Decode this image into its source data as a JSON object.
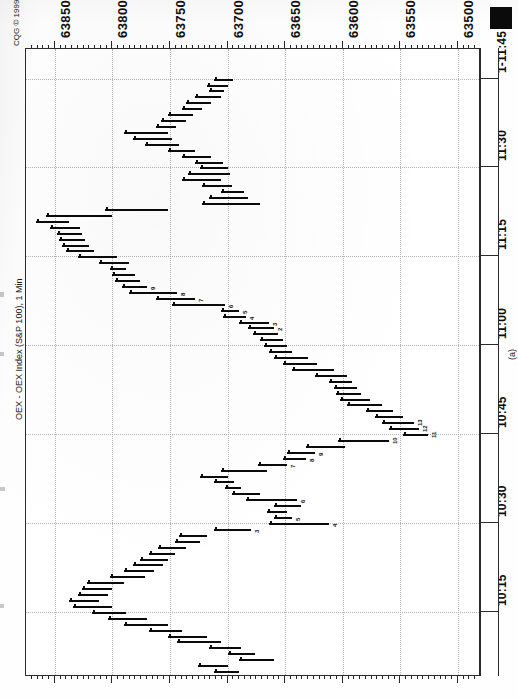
{
  "meta": {
    "vendor_copyright": "CQG © 1999.",
    "instrument_title": "OEX - OEX Index (S&P 100), 1 Min",
    "study_label": "TDSeq",
    "figure_caption": "(a)"
  },
  "price_axis": {
    "label_position": "top",
    "orientation": "vertical-text",
    "labels": [
      "63850",
      "63800",
      "63750",
      "63700",
      "63650",
      "63600",
      "63550",
      "63500"
    ],
    "values": [
      63850,
      63800,
      63750,
      63700,
      63650,
      63600,
      63550,
      63500
    ],
    "major_step": 50,
    "minor_step": 5
  },
  "time_axis": {
    "label_position": "right",
    "orientation": "vertical-text",
    "labels": [
      "1-11:45",
      "11:30",
      "11:15",
      "11:00",
      "10:45",
      "10:30",
      "10:15"
    ],
    "major_step_minutes": 15
  },
  "chart_data": {
    "type": "bar",
    "title": "OEX - OEX Index (S&P 100), 1 Min",
    "subtitle": "CQG © 1999.",
    "caption": "(a)",
    "study": "TDSeq",
    "xlabel": "Price",
    "ylabel": "Time",
    "grid": true,
    "legend": "none",
    "orientation": "rotated-90",
    "xlim": [
      63480,
      63875
    ],
    "ylim": [
      "10:05",
      "11:50"
    ],
    "x_ticks": [
      63850,
      63800,
      63750,
      63700,
      63650,
      63600,
      63550,
      63500
    ],
    "y_ticks": [
      "1-11:45",
      "11:30",
      "11:15",
      "11:00",
      "10:45",
      "10:30",
      "10:15"
    ],
    "series": [
      {
        "name": "OEX 1-min price bars",
        "note": "Each bar is one 1-minute high/low range plotted sideways; time runs top (11:45) to bottom (10:05).",
        "points": [
          {
            "t": "11:45",
            "low": 63695,
            "high": 63712,
            "td": null
          },
          {
            "t": "11:44",
            "low": 63700,
            "high": 63718,
            "td": null
          },
          {
            "t": "11:43",
            "low": 63703,
            "high": 63716,
            "td": null
          },
          {
            "t": "11:42",
            "low": 63706,
            "high": 63728,
            "td": null
          },
          {
            "t": "11:41",
            "low": 63714,
            "high": 63736,
            "td": null
          },
          {
            "t": "11:40",
            "low": 63722,
            "high": 63740,
            "td": null
          },
          {
            "t": "11:39",
            "low": 63730,
            "high": 63752,
            "td": null
          },
          {
            "t": "11:38",
            "low": 63736,
            "high": 63758,
            "td": null
          },
          {
            "t": "11:37",
            "low": 63745,
            "high": 63762,
            "td": null
          },
          {
            "t": "11:36",
            "low": 63752,
            "high": 63790,
            "td": null
          },
          {
            "t": "11:35",
            "low": 63748,
            "high": 63782,
            "td": null
          },
          {
            "t": "11:34",
            "low": 63742,
            "high": 63772,
            "td": null
          },
          {
            "t": "11:33",
            "low": 63728,
            "high": 63752,
            "td": null
          },
          {
            "t": "11:32",
            "low": 63714,
            "high": 63740,
            "td": null
          },
          {
            "t": "11:31",
            "low": 63704,
            "high": 63728,
            "td": null
          },
          {
            "t": "11:30",
            "low": 63700,
            "high": 63724,
            "td": null
          },
          {
            "t": "11:29",
            "low": 63698,
            "high": 63734,
            "td": null
          },
          {
            "t": "11:28",
            "low": 63706,
            "high": 63740,
            "td": null
          },
          {
            "t": "11:27",
            "low": 63696,
            "high": 63722,
            "td": null
          },
          {
            "t": "11:26",
            "low": 63686,
            "high": 63706,
            "td": null
          },
          {
            "t": "11:25",
            "low": 63682,
            "high": 63716,
            "td": null
          },
          {
            "t": "11:24",
            "low": 63672,
            "high": 63722,
            "td": null
          },
          {
            "t": "11:23",
            "low": 63752,
            "high": 63806,
            "td": null
          },
          {
            "t": "11:22",
            "low": 63800,
            "high": 63858,
            "td": null
          },
          {
            "t": "11:21",
            "low": 63838,
            "high": 63866,
            "td": null
          },
          {
            "t": "11:20",
            "low": 63828,
            "high": 63854,
            "td": null
          },
          {
            "t": "11:19",
            "low": 63826,
            "high": 63848,
            "td": null
          },
          {
            "t": "11:18",
            "low": 63824,
            "high": 63846,
            "td": null
          },
          {
            "t": "11:17",
            "low": 63820,
            "high": 63844,
            "td": null
          },
          {
            "t": "11:16",
            "low": 63816,
            "high": 63840,
            "td": null
          },
          {
            "t": "11:15",
            "low": 63796,
            "high": 63830,
            "td": null
          },
          {
            "t": "11:14",
            "low": 63786,
            "high": 63812,
            "td": null
          },
          {
            "t": "11:13",
            "low": 63788,
            "high": 63802,
            "td": null
          },
          {
            "t": "11:12",
            "low": 63780,
            "high": 63800,
            "td": null
          },
          {
            "t": "11:11",
            "low": 63776,
            "high": 63798,
            "td": null
          },
          {
            "t": "11:10",
            "low": 63770,
            "high": 63792,
            "td": "9"
          },
          {
            "t": "11:09",
            "low": 63744,
            "high": 63786,
            "td": "8"
          },
          {
            "t": "11:08",
            "low": 63728,
            "high": 63762,
            "td": "7"
          },
          {
            "t": "11:07",
            "low": 63702,
            "high": 63748,
            "td": "6"
          },
          {
            "t": "11:06",
            "low": 63690,
            "high": 63706,
            "td": "5"
          },
          {
            "t": "11:05",
            "low": 63684,
            "high": 63704,
            "td": "4"
          },
          {
            "t": "11:04",
            "low": 63664,
            "high": 63690,
            "td": "3"
          },
          {
            "t": "11:03",
            "low": 63660,
            "high": 63682,
            "td": "2"
          },
          {
            "t": "11:02",
            "low": 63656,
            "high": 63678,
            "td": null
          },
          {
            "t": "11:01",
            "low": 63652,
            "high": 63672,
            "td": null
          },
          {
            "t": "11:00",
            "low": 63648,
            "high": 63668,
            "td": null
          },
          {
            "t": "10:59",
            "low": 63644,
            "high": 63664,
            "td": null
          },
          {
            "t": "10:58",
            "low": 63630,
            "high": 63660,
            "td": null
          },
          {
            "t": "10:57",
            "low": 63622,
            "high": 63652,
            "td": null
          },
          {
            "t": "10:56",
            "low": 63608,
            "high": 63644,
            "td": null
          },
          {
            "t": "10:55",
            "low": 63596,
            "high": 63624,
            "td": null
          },
          {
            "t": "10:54",
            "low": 63592,
            "high": 63612,
            "td": null
          },
          {
            "t": "10:53",
            "low": 63588,
            "high": 63608,
            "td": null
          },
          {
            "t": "10:52",
            "low": 63584,
            "high": 63606,
            "td": null
          },
          {
            "t": "10:51",
            "low": 63576,
            "high": 63602,
            "td": null
          },
          {
            "t": "10:50",
            "low": 63566,
            "high": 63596,
            "td": null
          },
          {
            "t": "10:49",
            "low": 63556,
            "high": 63580,
            "td": null
          },
          {
            "t": "10:48",
            "low": 63548,
            "high": 63572,
            "td": null
          },
          {
            "t": "10:47",
            "low": 63538,
            "high": 63566,
            "td": "13"
          },
          {
            "t": "10:46",
            "low": 63534,
            "high": 63560,
            "td": "12"
          },
          {
            "t": "10:45",
            "low": 63526,
            "high": 63548,
            "td": "11"
          },
          {
            "t": "10:44",
            "low": 63560,
            "high": 63604,
            "td": "10"
          },
          {
            "t": "10:43",
            "low": 63598,
            "high": 63632,
            "td": null
          },
          {
            "t": "10:42",
            "low": 63624,
            "high": 63648,
            "td": "9"
          },
          {
            "t": "10:41",
            "low": 63632,
            "high": 63652,
            "td": "8"
          },
          {
            "t": "10:40",
            "low": 63648,
            "high": 63674,
            "td": "7"
          },
          {
            "t": "10:39",
            "low": 63666,
            "high": 63706,
            "td": null
          },
          {
            "t": "10:38",
            "low": 63700,
            "high": 63724,
            "td": null
          },
          {
            "t": "10:37",
            "low": 63694,
            "high": 63712,
            "td": null
          },
          {
            "t": "10:36",
            "low": 63688,
            "high": 63702,
            "td": null
          },
          {
            "t": "10:35",
            "low": 63672,
            "high": 63696,
            "td": null
          },
          {
            "t": "10:34",
            "low": 63640,
            "high": 63684,
            "td": "6"
          },
          {
            "t": "10:33",
            "low": 63636,
            "high": 63660,
            "td": null
          },
          {
            "t": "10:32",
            "low": 63648,
            "high": 63666,
            "td": null
          },
          {
            "t": "10:31",
            "low": 63644,
            "high": 63660,
            "td": "5"
          },
          {
            "t": "10:30",
            "low": 63612,
            "high": 63664,
            "td": "4"
          },
          {
            "t": "10:29",
            "low": 63680,
            "high": 63712,
            "td": "3"
          },
          {
            "t": "10:28",
            "low": 63718,
            "high": 63742,
            "td": null
          },
          {
            "t": "10:27",
            "low": 63724,
            "high": 63746,
            "td": null
          },
          {
            "t": "10:26",
            "low": 63736,
            "high": 63760,
            "td": null
          },
          {
            "t": "10:25",
            "low": 63746,
            "high": 63768,
            "td": null
          },
          {
            "t": "10:24",
            "low": 63752,
            "high": 63776,
            "td": null
          },
          {
            "t": "10:23",
            "low": 63756,
            "high": 63782,
            "td": null
          },
          {
            "t": "10:22",
            "low": 63764,
            "high": 63790,
            "td": null
          },
          {
            "t": "10:21",
            "low": 63772,
            "high": 63802,
            "td": null
          },
          {
            "t": "10:20",
            "low": 63790,
            "high": 63822,
            "td": null
          },
          {
            "t": "10:19",
            "low": 63800,
            "high": 63826,
            "td": null
          },
          {
            "t": "10:18",
            "low": 63804,
            "high": 63830,
            "td": null
          },
          {
            "t": "10:17",
            "low": 63812,
            "high": 63838,
            "td": null
          },
          {
            "t": "10:16",
            "low": 63800,
            "high": 63834,
            "td": null
          },
          {
            "t": "10:15",
            "low": 63788,
            "high": 63818,
            "td": null
          },
          {
            "t": "10:14",
            "low": 63770,
            "high": 63804,
            "td": null
          },
          {
            "t": "10:13",
            "low": 63752,
            "high": 63790,
            "td": null
          },
          {
            "t": "10:12",
            "low": 63740,
            "high": 63768,
            "td": null
          },
          {
            "t": "10:11",
            "low": 63718,
            "high": 63752,
            "td": null
          },
          {
            "t": "10:10",
            "low": 63706,
            "high": 63744,
            "td": null
          },
          {
            "t": "10:09",
            "low": 63688,
            "high": 63716,
            "td": null
          },
          {
            "t": "10:08",
            "low": 63676,
            "high": 63700,
            "td": null
          },
          {
            "t": "10:07",
            "low": 63660,
            "high": 63690,
            "td": null
          },
          {
            "t": "10:06",
            "low": 63700,
            "high": 63726,
            "td": null
          },
          {
            "t": "10:05",
            "low": 63690,
            "high": 63712,
            "td": null
          }
        ]
      }
    ]
  }
}
